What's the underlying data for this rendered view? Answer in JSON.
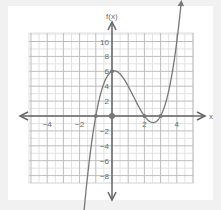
{
  "chart_data": {
    "type": "line",
    "title": "",
    "function": "f(x) = (x + 1)(x - 2)(x - 3)",
    "xlabel": "x",
    "ylabel": "f(x)",
    "xlim": [
      -5,
      5
    ],
    "ylim": [
      -9,
      11
    ],
    "grid": true,
    "x_ticks": [
      -4,
      -2,
      2,
      4
    ],
    "y_ticks": [
      10,
      8,
      6,
      4,
      2,
      -2,
      -4,
      -6,
      -8
    ],
    "marked_points": [
      {
        "x": -1,
        "y": 0
      },
      {
        "x": 0,
        "y": 0
      },
      {
        "x": 0,
        "y": 6
      },
      {
        "x": 2,
        "y": 0
      },
      {
        "x": 3,
        "y": 0
      }
    ],
    "key_features": {
      "x_intercepts": [
        -1,
        2,
        3
      ],
      "y_intercept": 6,
      "local_max": {
        "x": 0.2,
        "y": 6.1
      },
      "local_min": {
        "x": 2.5,
        "y": -0.9
      }
    },
    "colors": {
      "curve": "#777777",
      "axis": "#666666",
      "grid_major": "#bdbdbd",
      "grid_minor": "#e2e2e2"
    }
  },
  "labels": {
    "x_axis": "x",
    "y_axis": "f(x)",
    "x_ticks": [
      "−4",
      "−2",
      "2",
      "4"
    ],
    "y_ticks": [
      "10",
      "8",
      "6",
      "4",
      "2",
      "−2",
      "−4",
      "−6",
      "−8"
    ]
  }
}
